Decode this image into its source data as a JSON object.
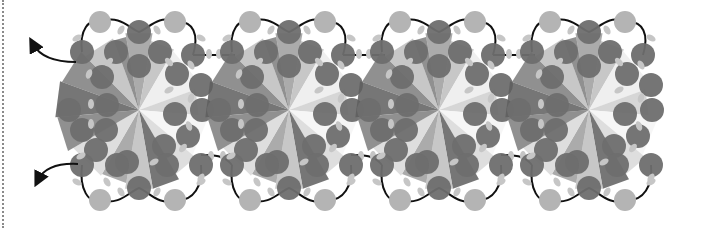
{
  "figure": {
    "type": "beadwork pattern diagram",
    "motif_count": 4,
    "motif_centers": [
      {
        "x": 139,
        "y": 110
      },
      {
        "x": 289,
        "y": 110
      },
      {
        "x": 439,
        "y": 110
      },
      {
        "x": 589,
        "y": 110
      }
    ],
    "thread_arrows": [
      {
        "label": "thread-exit-upper",
        "direction": "up-left"
      },
      {
        "label": "thread-exit-lower",
        "direction": "down-left"
      }
    ],
    "colors": {
      "background": "#ffffff",
      "dark_bead": "#6e6e6e",
      "light_bead": "#b4b4b4",
      "seed_bead": "#c6c6c6",
      "thread": "#111111",
      "border_dots": "#8a8a8a",
      "rays": [
        "#d8d8d8",
        "#bdbdbd",
        "#9c9c9c",
        "#7d7d7d",
        "#ececec",
        "#f4f4f4",
        "#cfcfcf",
        "#5e5e5e"
      ]
    }
  }
}
